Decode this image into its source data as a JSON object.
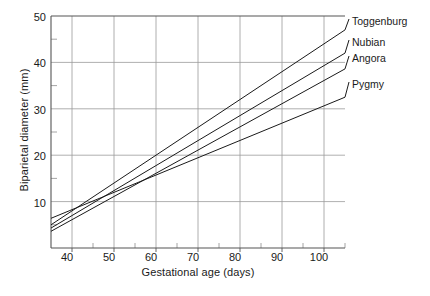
{
  "chart_data": {
    "type": "line",
    "title": "",
    "xlabel": "Gestational age (days)",
    "ylabel": "Biparietal diameter (mm)",
    "xlim": [
      35,
      105
    ],
    "ylim": [
      0,
      50
    ],
    "xticks": [
      40,
      50,
      60,
      70,
      80,
      90,
      100
    ],
    "xticklabels": [
      "40",
      "50",
      "60",
      "70",
      "80",
      "90",
      "100"
    ],
    "xminorticks": [
      35,
      45,
      55,
      65,
      75,
      85,
      95,
      105
    ],
    "yticks": [
      10,
      20,
      30,
      40,
      50
    ],
    "yticklabels": [
      "10",
      "20",
      "30",
      "40",
      "50"
    ],
    "yminorticks": [
      5,
      15,
      25,
      35,
      45
    ],
    "grid": true,
    "grid_color": "#9a9a9a",
    "axis_color": "#555555",
    "line_color": "#1a1a1a",
    "legend_position": "right-inline-labels",
    "x": [
      35,
      105
    ],
    "series": [
      {
        "name": "Toggenburg",
        "values": [
          5.0,
          47.0
        ],
        "label_x": 352,
        "label_y": 22
      },
      {
        "name": "Nubian",
        "values": [
          4.3,
          42.0
        ],
        "label_x": 352,
        "label_y": 43
      },
      {
        "name": "Angora",
        "values": [
          3.6,
          38.6
        ],
        "label_x": 352,
        "label_y": 59
      },
      {
        "name": "Pygmy",
        "values": [
          6.4,
          32.5
        ],
        "label_x": 352,
        "label_y": 85
      }
    ]
  },
  "axes": {
    "ylabel_text": "Biparietal diameter (mm)",
    "xlabel_text": "Gestational age (days)"
  },
  "labels": {
    "toggenburg": "Toggenburg",
    "nubian": "Nubian",
    "angora": "Angora",
    "pygmy": "Pygmy"
  },
  "xticklabels": {
    "t40": "40",
    "t50": "50",
    "t60": "60",
    "t70": "70",
    "t80": "80",
    "t90": "90",
    "t100": "100"
  },
  "yticklabels": {
    "t10": "10",
    "t20": "20",
    "t30": "30",
    "t40": "40",
    "t50": "50"
  }
}
